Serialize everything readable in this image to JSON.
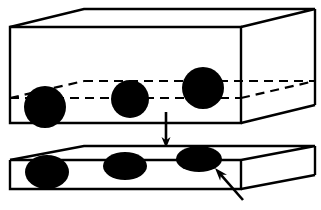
{
  "figure": {
    "background_color": "#ffffff",
    "line_color": "#000000",
    "inclusion_color": "#000000",
    "stroke_width_outline": 2.2,
    "stroke_width_hidden": 2.2,
    "hidden_dash_pattern": "9 6"
  },
  "upper_block": {
    "name": "thick-block",
    "front_face": {
      "top_left": [
        10,
        27
      ],
      "top_right": [
        241,
        27
      ],
      "bottom_right": [
        241,
        123
      ],
      "bottom_left": [
        10,
        123
      ]
    },
    "back_face": {
      "top_left": [
        84,
        9
      ],
      "top_right": [
        315,
        9
      ],
      "bottom_right": [
        315,
        105
      ]
    },
    "hidden_plane": {
      "front_edge": {
        "from": [
          10,
          98
        ],
        "to": [
          241,
          98
        ]
      },
      "back_edge": {
        "from": [
          84,
          81
        ],
        "to": [
          315,
          81
        ]
      },
      "left_receding_edge": {
        "from": [
          10,
          98
        ],
        "to": [
          84,
          81
        ]
      },
      "right_receding_edge": {
        "from": [
          241,
          98
        ],
        "to": [
          315,
          81
        ]
      }
    },
    "inclusions": [
      {
        "name": "sphere-1",
        "cx": 45,
        "cy": 107,
        "rx": 21,
        "ry": 21
      },
      {
        "name": "sphere-2",
        "cx": 130,
        "cy": 99,
        "rx": 19,
        "ry": 19
      },
      {
        "name": "sphere-3",
        "cx": 203,
        "cy": 88,
        "rx": 21,
        "ry": 21
      }
    ]
  },
  "lower_block": {
    "name": "thin-slab",
    "front_face": {
      "top_left": [
        10,
        160
      ],
      "top_right": [
        241,
        160
      ],
      "bottom_right": [
        241,
        189
      ],
      "bottom_left": [
        10,
        189
      ]
    },
    "back_face": {
      "top_left": [
        84,
        146
      ],
      "top_right": [
        315,
        146
      ],
      "bottom_right": [
        315,
        175
      ]
    },
    "inclusions": [
      {
        "name": "flattened-inclusion-1",
        "cx": 47,
        "cy": 172,
        "rx": 22,
        "ry": 17
      },
      {
        "name": "flattened-inclusion-2",
        "cx": 125,
        "cy": 166,
        "rx": 22,
        "ry": 14
      },
      {
        "name": "flattened-inclusion-3",
        "cx": 199,
        "cy": 159,
        "rx": 23,
        "ry": 13
      }
    ]
  },
  "process_arrow": {
    "name": "downward-process-arrow",
    "from": [
      166,
      112
    ],
    "to": [
      166,
      148
    ],
    "head_width": 9,
    "head_length": 11
  },
  "pointer_arrow": {
    "name": "inclusion-pointer-arrow",
    "from": [
      243,
      200
    ],
    "to": [
      215,
      168
    ],
    "head_width": 9,
    "head_length": 13
  }
}
